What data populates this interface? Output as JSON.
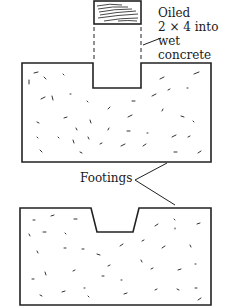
{
  "diagram": {
    "labels": {
      "oiled_line1": "Oiled",
      "oiled_line2": "2 × 4 into",
      "oiled_line3": "wet",
      "oiled_line4": "concrete",
      "footings": "Footings"
    },
    "elements": [
      {
        "id": "lumber-block",
        "description": "2×4 lumber end (wood grain)"
      },
      {
        "id": "upper-footing",
        "description": "Concrete footing with rectangular notch formed by 2×4"
      },
      {
        "id": "lower-footing",
        "description": "Concrete footing with tapered keyway notch"
      }
    ],
    "colors": {
      "stroke": "#222222",
      "background": "#ffffff"
    }
  }
}
